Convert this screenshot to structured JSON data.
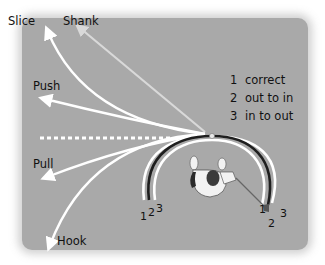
{
  "shot_labels": {
    "slice": "Slice",
    "shank": "Shank",
    "push": "Push",
    "pull": "Pull",
    "hook": "Hook"
  },
  "legend": [
    {
      "num": "1",
      "text": "correct"
    },
    {
      "num": "2",
      "text": "out to in"
    },
    {
      "num": "3",
      "text": "in to out"
    }
  ],
  "arc_numbers_left": [
    "1",
    "2",
    "3"
  ],
  "arc_numbers_right": [
    "1",
    "2",
    "3"
  ],
  "colors": {
    "panel": "#a9a9a9",
    "path_white": "#ffffff",
    "path_dark": "#1e1e1e",
    "shank_line": "#d9d9d9"
  }
}
